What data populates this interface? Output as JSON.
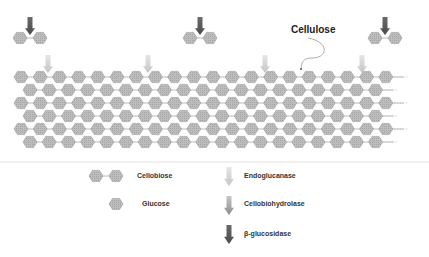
{
  "diagram": {
    "title_label": "Cellulose",
    "colors": {
      "hex_fill": "#b8b8b8",
      "hex_stroke": "#9a9a9a",
      "bond": "#a8a8a8",
      "separator": "#e2e2e2",
      "endoglucanase": "#cfcfcf",
      "cellobiohydrolase": "#a9a9a9",
      "beta_glucosidase": "#595959"
    },
    "cellulose": {
      "rows": 6,
      "row_y_start": 77,
      "row_spacing": 13,
      "hex_spacing": 19.2,
      "even_row_x_start": 21,
      "odd_row_x_start": 30,
      "hexes_per_row": 20,
      "hex_radius": 7
    },
    "chain_arrows": [
      {
        "x": 48,
        "type": "endoglucanase"
      },
      {
        "x": 148,
        "type": "endoglucanase"
      },
      {
        "x": 265,
        "type": "endoglucanase"
      },
      {
        "x": 362,
        "type": "endoglucanase"
      }
    ],
    "released_cellobiose": [
      {
        "x": 30,
        "y": 38,
        "arrow": "beta_glucosidase"
      },
      {
        "x": 200,
        "y": 38,
        "arrow": "beta_glucosidase"
      },
      {
        "x": 385,
        "y": 38,
        "arrow": "beta_glucosidase"
      }
    ],
    "cellulose_pointer": {
      "label_x": 290,
      "label_y": 30,
      "dot_x": 301,
      "dot_y": 69
    }
  },
  "legend": {
    "items": [
      {
        "id": "cellobiose",
        "label": "Cellobiose",
        "symbol": "hex-pair"
      },
      {
        "id": "glucose",
        "label": "Glucose",
        "symbol": "hex-single"
      },
      {
        "id": "endoglucanase",
        "label": "Endoglucanase",
        "symbol": "arrow-light"
      },
      {
        "id": "cellobiohydrolase",
        "label": "Cellobiohydrolase",
        "symbol": "arrow-medium"
      },
      {
        "id": "beta_glucosidase",
        "label": "β-glucosidase",
        "symbol": "arrow-dark"
      }
    ]
  }
}
